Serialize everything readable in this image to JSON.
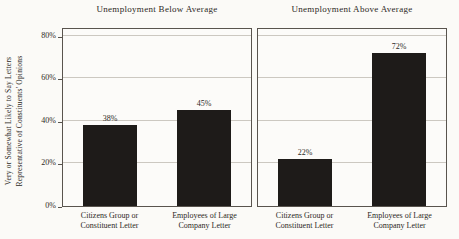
{
  "chart_data": {
    "type": "bar",
    "ylabel": "Very or Somewhat Likely to Say Letters Representative of Constituents' Opinions",
    "ylabel_lines": [
      "Very or Somewhat Likely to Say Letters",
      "Representative of Constituents' Opinions"
    ],
    "ylim": [
      0,
      84
    ],
    "yticks": [
      0,
      20,
      40,
      60,
      80
    ],
    "ytick_labels": [
      "0%",
      "20%",
      "40%",
      "60%",
      "80%"
    ],
    "grid": true,
    "legend_position": "none",
    "categories": [
      "Citizens Group or Constituent Letter",
      "Employees of Large Company Letter"
    ],
    "panels": [
      {
        "title": "Unemployment Below Average",
        "series_values": [
          38,
          45
        ],
        "value_labels": [
          "38%",
          "45%"
        ]
      },
      {
        "title": "Unemployment Above Average",
        "series_values": [
          22,
          72
        ],
        "value_labels": [
          "22%",
          "72%"
        ]
      }
    ],
    "bar_color": "#1e1b19",
    "axis_color": "#59544e",
    "gridline_color": "#ccc8c1"
  }
}
